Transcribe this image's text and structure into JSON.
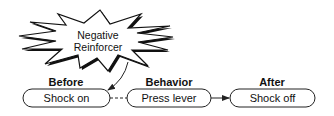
{
  "diagram": {
    "type": "contingency-flow",
    "starburst": {
      "line1": "Negative",
      "line2": "Reinforcer"
    },
    "columns": [
      {
        "heading": "Before",
        "box": "Shock on"
      },
      {
        "heading": "Behavior",
        "box": "Press lever"
      },
      {
        "heading": "After",
        "box": "Shock off"
      }
    ],
    "connectors": [
      {
        "from": "Shock on",
        "to": "Press lever",
        "style": "dashed"
      },
      {
        "from": "Press lever",
        "to": "Shock off",
        "style": "solid-arrow"
      },
      {
        "from": "Negative Reinforcer",
        "to": "Shock on",
        "style": "curved-arrow"
      }
    ],
    "colors": {
      "stroke": "#222222",
      "fill": "#ffffff",
      "text": "#111111"
    }
  }
}
